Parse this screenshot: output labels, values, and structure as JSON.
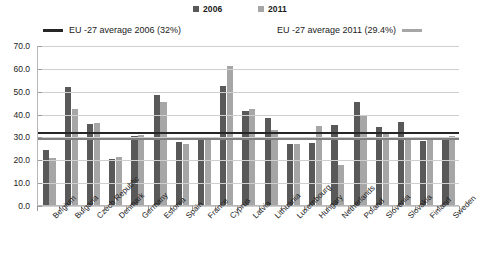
{
  "legend": {
    "series": [
      {
        "label": "2006",
        "color": "#595959",
        "icon": "square-marker-icon"
      },
      {
        "label": "2011",
        "color": "#a6a6a6",
        "icon": "square-marker-icon"
      }
    ],
    "averages": [
      {
        "label": "EU -27 average 2006 (32%)",
        "color": "#262626",
        "icon": "line-marker-icon"
      },
      {
        "label": "EU -27 average 2011 (29.4%)",
        "color": "#7f7f7f",
        "icon": "line-marker-icon"
      }
    ]
  },
  "yaxis": {
    "ticks": [
      "70.0",
      "60.0",
      "50.0",
      "40.0",
      "30.0",
      "20.0",
      "10.0",
      "0.0"
    ]
  },
  "chart_data": {
    "type": "bar",
    "title": "",
    "xlabel": "",
    "ylabel": "",
    "ylim": [
      0,
      70
    ],
    "ytick_step": 10,
    "grid": true,
    "legend_position": "top",
    "categories": [
      "Belgium",
      "Bulgaria",
      "Czech Republic",
      "Denmark",
      "Germany",
      "Estonia",
      "Spain",
      "France",
      "Cyprus",
      "Latvia",
      "Lithuania",
      "Luxembourg",
      "Hungary",
      "Netherlands",
      "Poland",
      "Slovenia",
      "Slovakia",
      "Finland",
      "Sweden"
    ],
    "series": [
      {
        "name": "2006",
        "color": "#595959",
        "values": [
          24.0,
          51.5,
          35.5,
          20.0,
          30.0,
          48.0,
          27.5,
          29.0,
          52.0,
          41.0,
          38.0,
          26.5,
          27.0,
          35.0,
          45.0,
          34.0,
          36.5,
          28.0,
          29.5
        ]
      },
      {
        "name": "2011",
        "color": "#a6a6a6",
        "values": [
          20.5,
          42.0,
          36.0,
          21.0,
          30.5,
          45.0,
          26.5,
          29.0,
          61.0,
          42.0,
          33.0,
          26.5,
          34.5,
          17.5,
          39.0,
          32.0,
          29.5,
          28.5,
          30.0
        ]
      }
    ],
    "reference_lines": [
      {
        "name": "EU -27 average 2006 (32%)",
        "value": 32.0,
        "color": "#262626"
      },
      {
        "name": "EU -27 average 2011 (29.4%)",
        "value": 29.4,
        "color": "#7f7f7f"
      }
    ]
  }
}
